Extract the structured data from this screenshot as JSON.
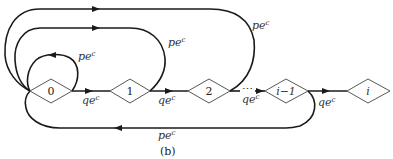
{
  "diagram": {
    "caption": "(b)",
    "nodes": [
      {
        "id": "0",
        "label": "0"
      },
      {
        "id": "1",
        "label": "1"
      },
      {
        "id": "2",
        "label": "2"
      },
      {
        "id": "i-1",
        "label": "i−1"
      },
      {
        "id": "i",
        "label": "i"
      }
    ],
    "edges": {
      "self_loop_0": {
        "label": "pe",
        "sup": "c"
      },
      "loop_1_to_0": {
        "label": "pe",
        "sup": "c"
      },
      "loop_2_to_0": {
        "label": "pe",
        "sup": "c"
      },
      "loop_im1_to_0": {
        "label": "pe",
        "sup": "c"
      },
      "fwd_0_1": {
        "label": "qe",
        "sup": "c"
      },
      "fwd_1_2": {
        "label": "qe",
        "sup": "c"
      },
      "fwd_2_im1": {
        "label": "qe",
        "sup": "c"
      },
      "fwd_im1_i": {
        "label": "qe",
        "sup": "c"
      }
    },
    "ellipsis": "⋯"
  }
}
